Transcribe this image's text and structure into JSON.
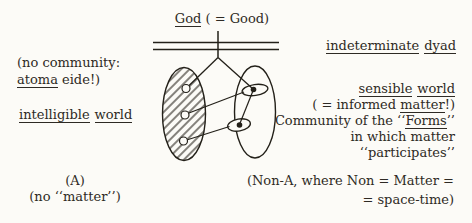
{
  "colors": {
    "background": "#fcfbf7",
    "ink": "#2e2a24",
    "line": "#232019"
  },
  "top": {
    "god": "God",
    "god_suffix": " ( = Good)"
  },
  "left": {
    "community_line1": "(no community:",
    "community_line2_u": "atoma",
    "community_line2_rest": " eide!)",
    "world_w1": "intelligible",
    "world_w2": "world",
    "a_label": "(A)",
    "no_matter": "(no ‘‘matter’’)"
  },
  "right": {
    "dyad_w1": "indeterminate",
    "dyad_w2": "dyad",
    "sensible_w1": "sensible",
    "sensible_w2": "world",
    "informed_open": "( = informed ",
    "informed_u": "matter",
    "informed_close": "!)",
    "community_open": "Community of the ‘‘",
    "community_u": "Forms",
    "community_close": "’’",
    "in_which": "in which matter",
    "participates": "‘‘participates’’",
    "non_a_line1": "(Non-A, where Non = Matter =",
    "non_a_line2": "= space-time)"
  }
}
